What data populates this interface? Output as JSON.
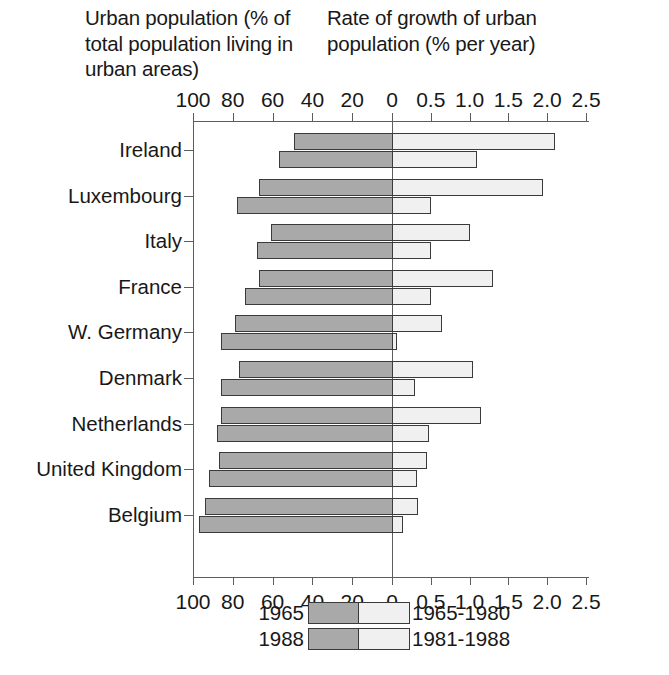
{
  "titles": {
    "left": "Urban population (% of total population living in urban areas)",
    "right": "Rate of growth of urban population (% per year)"
  },
  "legend": {
    "left_1965": "1965",
    "left_1988": "1988",
    "right_1965_1980": "1965-1980",
    "right_1981_1988": "1981-1988"
  },
  "colors": {
    "dark_gray_bar": "#a9a9a9",
    "light_gray_bar": "#f0f0f0",
    "bar_outline": "#3a3a3a",
    "axis": "#5d5d5d",
    "text": "#181818"
  },
  "chart_data": {
    "type": "bar",
    "title": "",
    "orientation": "horizontal",
    "layout": "back-to-back / bidirectional paired bars",
    "grid": false,
    "legend_position": "bottom-center",
    "categories": [
      "Ireland",
      "Luxembourg",
      "Italy",
      "France",
      "W. Germany",
      "Denmark",
      "Netherlands",
      "United Kingdom",
      "Belgium"
    ],
    "left_panel": {
      "xlabel": "Urban population (% of total population living in urban areas)",
      "xlim": [
        100,
        0
      ],
      "xticks": [
        100,
        80,
        60,
        40,
        20,
        0
      ],
      "xticklabels": [
        "100",
        "80",
        "60",
        "40",
        "20",
        "0"
      ],
      "direction": "right-to-left (100 at left edge, 0 at center)",
      "series": [
        {
          "name": "1965",
          "values": [
            49,
            67,
            61,
            67,
            79,
            77,
            86,
            87,
            94
          ]
        },
        {
          "name": "1988",
          "values": [
            57,
            78,
            68,
            74,
            86,
            86,
            88,
            92,
            97
          ]
        }
      ]
    },
    "right_panel": {
      "xlabel": "Rate of growth of urban population (% per year)",
      "xlim": [
        0,
        2.5
      ],
      "xticks": [
        0,
        0.5,
        1.0,
        1.5,
        2.0,
        2.5
      ],
      "xticklabels": [
        "0",
        "0.5",
        "1.0",
        "1.5",
        "2.0",
        "2.5"
      ],
      "direction": "left-to-right (0 at center)",
      "series": [
        {
          "name": "1965-1980",
          "values": [
            2.1,
            1.95,
            1.0,
            1.3,
            0.65,
            1.05,
            1.15,
            0.45,
            0.33
          ]
        },
        {
          "name": "1981-1988",
          "values": [
            1.1,
            0.5,
            0.5,
            0.5,
            0.07,
            0.3,
            0.48,
            0.32,
            0.14
          ]
        }
      ]
    }
  }
}
